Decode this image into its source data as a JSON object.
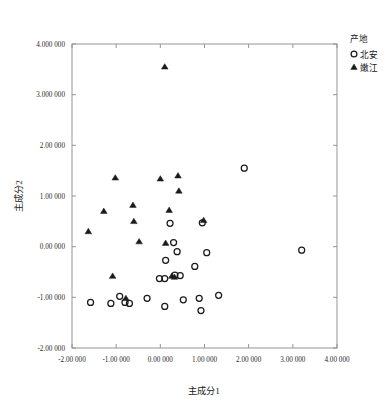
{
  "chart_data": {
    "type": "scatter",
    "title": "",
    "xlabel": "主成分1",
    "ylabel": "主成分2",
    "xlim": [
      -2.0,
      4.0
    ],
    "ylim": [
      -2.0,
      4.0
    ],
    "grid": false,
    "legend_position": "top-right",
    "x_tick_labels": [
      "-2.00 000",
      "-1.00 000",
      "0.00 000",
      "1.00 000",
      "2.00 000",
      "3.00 000",
      "4.00 000"
    ],
    "x_tick_values": [
      -2,
      -1,
      0,
      1,
      2,
      3,
      4
    ],
    "y_tick_labels": [
      "4.000 000",
      "3.000 000",
      "2.00 000",
      "1.00 000",
      "0.00 000",
      "-1.00 000",
      "-2.00 000"
    ],
    "y_tick_values": [
      4,
      3,
      2,
      1,
      0,
      -1,
      -2
    ],
    "legend": {
      "title": "产地",
      "entries": [
        {
          "label": "北安",
          "marker": "circle-open-icon"
        },
        {
          "label": "嫩江",
          "marker": "triangle-filled-icon"
        }
      ]
    },
    "series": [
      {
        "name": "北安",
        "marker": "circle",
        "points": [
          [
            1.9,
            1.55
          ],
          [
            0.95,
            0.47
          ],
          [
            0.22,
            0.46
          ],
          [
            0.3,
            0.08
          ],
          [
            0.38,
            -0.1
          ],
          [
            1.05,
            -0.12
          ],
          [
            3.2,
            -0.07
          ],
          [
            0.12,
            -0.27
          ],
          [
            0.78,
            -0.39
          ],
          [
            0.33,
            -0.56
          ],
          [
            0.45,
            -0.57
          ],
          [
            -0.02,
            -0.63
          ],
          [
            0.1,
            -0.63
          ],
          [
            -1.58,
            -1.1
          ],
          [
            -1.12,
            -1.12
          ],
          [
            -0.92,
            -0.98
          ],
          [
            -0.8,
            -1.1
          ],
          [
            -0.7,
            -1.12
          ],
          [
            -0.3,
            -1.02
          ],
          [
            0.1,
            -1.18
          ],
          [
            0.52,
            -1.05
          ],
          [
            0.88,
            -1.02
          ],
          [
            0.92,
            -1.26
          ],
          [
            1.32,
            -0.96
          ]
        ]
      },
      {
        "name": "嫩江",
        "marker": "triangle",
        "points": [
          [
            0.1,
            3.55
          ],
          [
            -1.02,
            1.36
          ],
          [
            0.0,
            1.34
          ],
          [
            0.4,
            1.4
          ],
          [
            0.42,
            1.1
          ],
          [
            -1.63,
            0.3
          ],
          [
            -1.28,
            0.7
          ],
          [
            -0.62,
            0.82
          ],
          [
            0.2,
            0.72
          ],
          [
            -0.6,
            0.5
          ],
          [
            0.98,
            0.52
          ],
          [
            -0.48,
            0.1
          ],
          [
            0.12,
            0.07
          ],
          [
            -1.08,
            -0.58
          ],
          [
            0.26,
            -0.58
          ],
          [
            0.32,
            -0.6
          ],
          [
            -0.78,
            -1.02
          ]
        ]
      }
    ]
  }
}
